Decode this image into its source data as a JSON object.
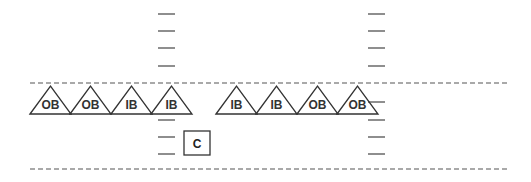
{
  "diagram": {
    "colors": {
      "stroke": "#333333",
      "tick": "#444444",
      "dash": "#555555",
      "background": "#ffffff"
    },
    "lane_lines": [
      {
        "name": "top-dashed-line",
        "y": 83,
        "x1": 30,
        "x2": 510
      },
      {
        "name": "bottom-dashed-line",
        "y": 169,
        "x1": 30,
        "x2": 510
      }
    ],
    "left_ticks": {
      "x1": 158,
      "x2": 175,
      "ys": [
        14,
        31,
        48,
        66,
        120,
        137,
        154
      ]
    },
    "right_ticks": {
      "x1": 368,
      "x2": 385,
      "ys": [
        14,
        31,
        48,
        66,
        102,
        120,
        137,
        154
      ]
    },
    "triangles": [
      {
        "label": "OB",
        "x": 30
      },
      {
        "label": "OB",
        "x": 70
      },
      {
        "label": "IB",
        "x": 111
      },
      {
        "label": "IB",
        "x": 151
      },
      {
        "label": "IB",
        "x": 216
      },
      {
        "label": "IB",
        "x": 256
      },
      {
        "label": "OB",
        "x": 297
      },
      {
        "label": "OB",
        "x": 337
      }
    ],
    "box": {
      "label": "C",
      "x": 184,
      "y": 131,
      "w": 26,
      "h": 24
    }
  }
}
